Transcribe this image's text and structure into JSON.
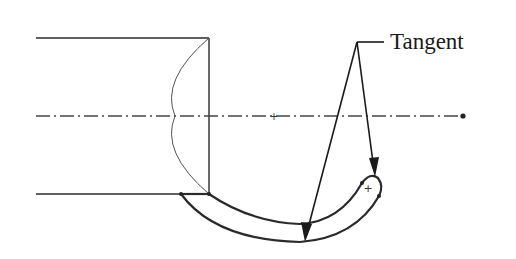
{
  "diagram": {
    "annotation_label": "Tangent",
    "annotation_target_count": 2,
    "colors": {
      "line": "#2a2a2a",
      "thin_line": "#555555",
      "centerline": "#444444",
      "background": "#ffffff"
    }
  }
}
